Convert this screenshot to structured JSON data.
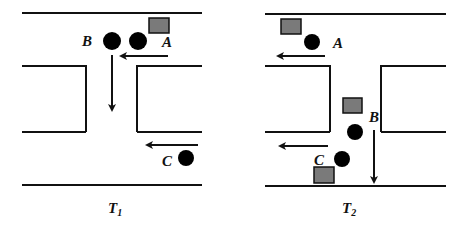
{
  "panels": [
    {
      "caption": "T",
      "caption_sub": "1",
      "labels": {
        "a": "A",
        "b": "B",
        "c": "C"
      }
    },
    {
      "caption": "T",
      "caption_sub": "2",
      "labels": {
        "a": "A",
        "b": "B",
        "c": "C"
      }
    }
  ],
  "colors": {
    "line": "#111111",
    "agent": "#000000",
    "vehicle_fill": "#7a7a7a",
    "vehicle_stroke": "#111111"
  }
}
